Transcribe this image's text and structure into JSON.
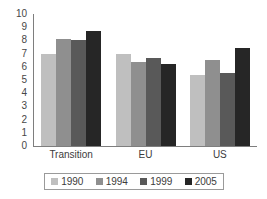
{
  "chart_data": {
    "type": "bar",
    "title": "",
    "subtitle": "",
    "xlabel": "",
    "ylabel": "",
    "categories": [
      "Transition",
      "EU",
      "US"
    ],
    "series": [
      {
        "name": "1990",
        "color": "#bfbfbf",
        "values": [
          7.0,
          7.0,
          5.4
        ]
      },
      {
        "name": "1994",
        "color": "#8f8f8f",
        "values": [
          8.1,
          6.35,
          6.5
        ]
      },
      {
        "name": "1999",
        "color": "#595959",
        "values": [
          8.0,
          6.7,
          5.55
        ]
      },
      {
        "name": "2005",
        "color": "#262626",
        "values": [
          8.75,
          6.2,
          7.45
        ]
      }
    ],
    "ylim": [
      0,
      10
    ],
    "y_ticks": [
      "0",
      "1",
      "2",
      "3",
      "4",
      "5",
      "6",
      "7",
      "8",
      "9",
      "10"
    ],
    "grid": false,
    "legend_position": "bottom",
    "axis_color": "#7e7e7e",
    "background": "#ffffff"
  }
}
